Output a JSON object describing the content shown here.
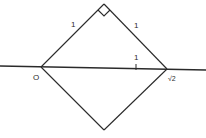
{
  "diagram": {
    "colors": {
      "stroke": "#2a2a2a",
      "background": "#ffffff"
    },
    "labels": {
      "origin": "O",
      "sqrt2": "√2",
      "upper_left_side": "1",
      "upper_right_side": "1",
      "unit_tick": "1"
    },
    "points": {
      "origin": [
        41,
        67
      ],
      "sqrt2": [
        167,
        69
      ],
      "top_vertex": [
        104,
        4
      ],
      "bottom_vertex": [
        104,
        130
      ],
      "unit_tick": [
        136,
        68
      ]
    },
    "number_line": {
      "from": [
        0,
        66
      ],
      "to": [
        206,
        70
      ]
    },
    "right_angle_at": "top_vertex"
  }
}
